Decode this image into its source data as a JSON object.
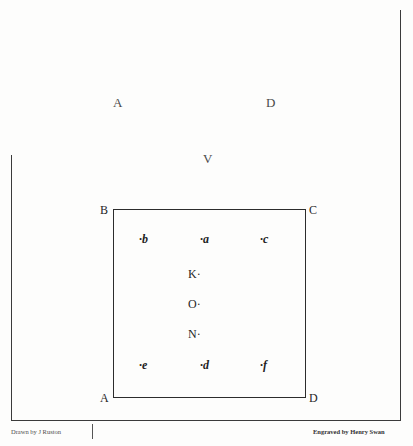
{
  "plate": {
    "background_color": "#fdfdfc",
    "ink_color": "#2c2c2c"
  },
  "outer_labels": [
    {
      "id": "outer-a",
      "text": "A",
      "x": 113,
      "y": 96
    },
    {
      "id": "outer-d",
      "text": "D",
      "x": 266,
      "y": 96
    },
    {
      "id": "outer-v",
      "text": "V",
      "x": 203,
      "y": 152
    }
  ],
  "square": {
    "corners": [
      {
        "id": "corner-b",
        "text": "B",
        "x": 100,
        "y": 204
      },
      {
        "id": "corner-c",
        "text": "C",
        "x": 309,
        "y": 204
      },
      {
        "id": "corner-a",
        "text": "A",
        "x": 100,
        "y": 392
      },
      {
        "id": "corner-d",
        "text": "D",
        "x": 309,
        "y": 392
      }
    ]
  },
  "points": {
    "top_row": [
      {
        "id": "point-b",
        "text": "·b",
        "x": 139,
        "y": 233
      },
      {
        "id": "point-a",
        "text": "·a",
        "x": 200,
        "y": 233
      },
      {
        "id": "point-c",
        "text": "·c",
        "x": 260,
        "y": 233
      }
    ],
    "center_column": [
      {
        "id": "point-k",
        "text": "K·",
        "x": 188,
        "y": 268
      },
      {
        "id": "point-o",
        "text": "O·",
        "x": 188,
        "y": 298
      },
      {
        "id": "point-n",
        "text": "N·",
        "x": 188,
        "y": 328
      }
    ],
    "bottom_row": [
      {
        "id": "point-e",
        "text": "·e",
        "x": 139,
        "y": 359
      },
      {
        "id": "point-d",
        "text": "·d",
        "x": 200,
        "y": 359
      },
      {
        "id": "point-f",
        "text": "·f",
        "x": 260,
        "y": 359
      }
    ]
  },
  "credits": {
    "drawn_by": "Drawn by J Ruston",
    "engraved_by": "Engraved by Henry Swan"
  }
}
